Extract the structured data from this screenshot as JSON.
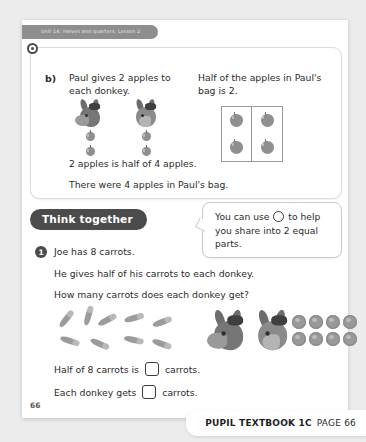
{
  "unit_tab": {
    "label": "Unit 14: Halves and quarters, Lesson 2"
  },
  "card": {
    "question_label": "b)",
    "left_prompt": "Paul gives 2 apples to each donkey.",
    "right_prompt": "Half of the apples in Paul's bag is 2.",
    "answer_line_1": "2 apples is half of 4 apples.",
    "answer_line_2": "There were 4 apples in Paul's bag.",
    "donkey_count": 2,
    "apples_per_donkey": 2,
    "grid_apples": 4
  },
  "think_together": {
    "label": "Think together"
  },
  "callout": {
    "text_before": "You can use",
    "text_after": "to help you share into 2 equal parts.",
    "icon": "counter-circle-icon"
  },
  "question_1": {
    "number": "1",
    "line_1": "Joe has 8 carrots.",
    "line_2": "He gives half of his carrots to each donkey.",
    "line_3": "How many carrots does each donkey get?",
    "carrot_count": 8,
    "donkey_count": 2,
    "counter_count": 8,
    "answer_1_before": "Half of 8 carrots is",
    "answer_1_after": "carrots.",
    "answer_2_before": "Each donkey gets",
    "answer_2_after": "carrots.",
    "answer_1_value": "",
    "answer_2_value": ""
  },
  "page_number": "66",
  "footer": {
    "book": "PUPIL TEXTBOOK 1C",
    "page": "PAGE 66"
  },
  "colors": {
    "accent_dark": "#4b4b4b",
    "tab_gray": "#8e8e8e",
    "page_bg": "#ffffff",
    "canvas_bg": "#ececec"
  }
}
